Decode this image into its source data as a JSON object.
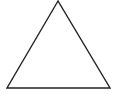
{
  "diagram": {
    "shape": "triangle",
    "stroke_color": "#222222",
    "fill_color": "#ffffff",
    "background": "#ffffff",
    "vertices": {
      "apex": [
        58,
        1
      ],
      "bottom_left": [
        7,
        88
      ],
      "bottom_right": [
        110,
        88
      ]
    }
  }
}
